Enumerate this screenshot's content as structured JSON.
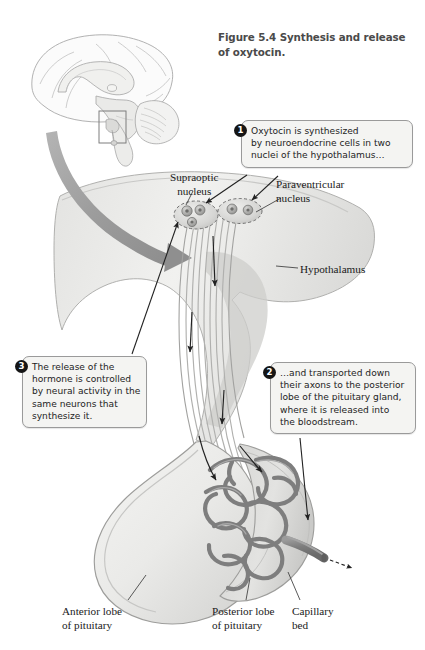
{
  "figure": {
    "number": "Figure 5.4",
    "title": "Synthesis and release",
    "title_line2": "of oxytocin."
  },
  "callouts": [
    {
      "number": "1",
      "lines": [
        "Oxytocin is synthesized",
        "by neuroendocrine cells in two",
        "nuclei of the hypothalamus…"
      ]
    },
    {
      "number": "2",
      "lines": [
        "…and transported down",
        "their axons to the posterior",
        "lobe of the pituitary gland,",
        "where it is released into",
        "the bloodstream."
      ]
    },
    {
      "number": "3",
      "lines": [
        "The release of the",
        "hormone is controlled",
        "by neural activity in the",
        "same neurons that",
        "synthesize it."
      ]
    }
  ],
  "labels": {
    "supraoptic": {
      "line1": "Supraoptic",
      "line2": "nucleus"
    },
    "paraventricular": {
      "line1": "Paraventricular",
      "line2": "nucleus"
    },
    "hypothalamus": {
      "line1": "Hypothalamus"
    },
    "anterior_lobe": {
      "line1": "Anterior lobe",
      "line2": "of pituitary"
    },
    "posterior_lobe": {
      "line1": "Posterior lobe",
      "line2": "of pituitary"
    },
    "capillary_bed": {
      "line1": "Capillary",
      "line2": "bed"
    }
  },
  "colors": {
    "page_background": "#ffffff",
    "callout_fill": "#f4f4f2",
    "callout_border": "#9a9a9a",
    "badge_fill": "#151515",
    "title_text": "#4a4a4a",
    "tissue_light": "#ededeb",
    "tissue_mid": "#d8d8d6",
    "tissue_dark": "#b9b9b7",
    "capillary": "#7e7e7e",
    "zoom_arrow": "#9c9c9c",
    "outline": "#8e8e8e",
    "leader_line": "#3c3c3c"
  },
  "illustration": {
    "brain_inset": "mid-sagittal brain section with hypothalamus region boxed",
    "zoom_arrow": "thick curved gray arrow from brain inset to enlarged hypothalamus",
    "nuclei": [
      "supraoptic nucleus",
      "paraventricular nucleus"
    ],
    "axon_tract": "neurosecretory axons descending through infundibulum",
    "capillary_bed": "tangled capillary plexus in posterior pituitary",
    "efferent_vessel": "vein carrying oxytocin into bloodstream"
  }
}
